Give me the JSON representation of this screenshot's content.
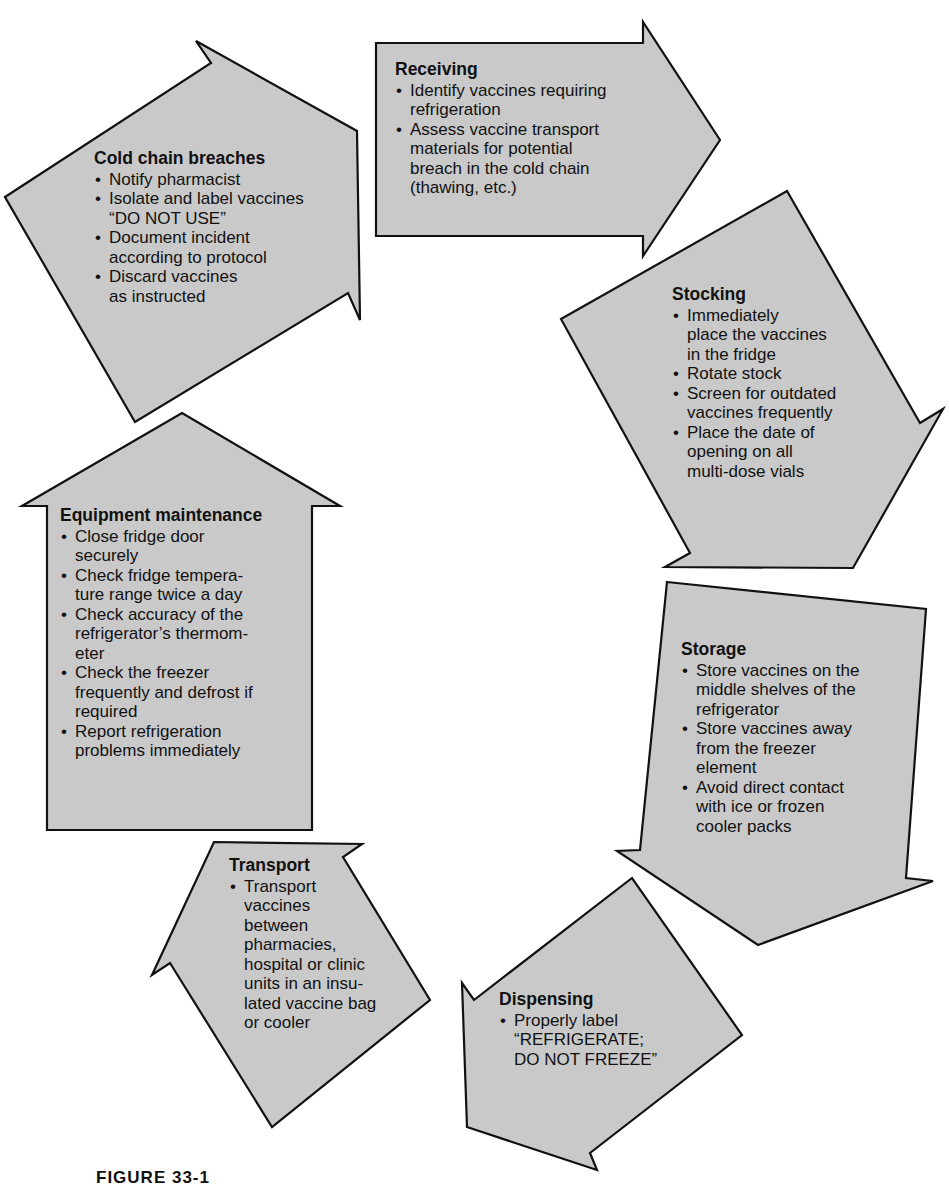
{
  "colors": {
    "arrow_fill": "#c9c9c9",
    "arrow_stroke": "#111111",
    "background": "#ffffff"
  },
  "diagram": {
    "type": "cycle",
    "steps": [
      {
        "id": "receiving",
        "title": "Receiving",
        "direction": "right",
        "bullets": [
          "Identify vaccines requiring\nrefrigeration",
          "Assess vaccine transport\nmaterials for potential\nbreach in the cold chain\n(thawing, etc.)"
        ]
      },
      {
        "id": "stocking",
        "title": "Stocking",
        "direction": "down-right",
        "bullets": [
          "Immediately\nplace the vaccines\nin the fridge",
          "Rotate stock",
          "Screen for outdated\nvaccines frequently",
          "Place the date of\nopening on all\nmulti-dose vials"
        ]
      },
      {
        "id": "storage",
        "title": "Storage",
        "direction": "down",
        "bullets": [
          "Store vaccines on the\nmiddle shelves of the\nrefrigerator",
          "Store vaccines away\nfrom the freezer\nelement",
          "Avoid direct contact\nwith ice or frozen\ncooler packs"
        ]
      },
      {
        "id": "dispensing",
        "title": "Dispensing",
        "direction": "down-left",
        "bullets": [
          "Properly label\n“REFRIGERATE;\nDO NOT FREEZE”"
        ]
      },
      {
        "id": "transport",
        "title": "Transport",
        "direction": "up-left",
        "bullets": [
          "Transport\nvaccines\nbetween\npharmacies,\nhospital or clinic\nunits in an insu-\nlated vaccine bag\nor cooler"
        ]
      },
      {
        "id": "equipment_maintenance",
        "title": "Equipment maintenance",
        "direction": "up",
        "bullets": [
          "Close fridge door\nsecurely",
          "Check fridge tempera-\nture range twice a day",
          "Check accuracy of the\nrefrigerator’s thermom-\neter",
          "Check the freezer\nfrequently and defrost if\nrequired",
          "Report refrigeration\nproblems immediately"
        ]
      },
      {
        "id": "cold_chain_breaches",
        "title": "Cold chain breaches",
        "direction": "up-right",
        "bullets": [
          "Notify pharmacist",
          "Isolate and label vaccines\n“DO NOT USE”",
          "Document incident\naccording to protocol",
          "Discard vaccines\nas instructed"
        ]
      }
    ]
  },
  "caption": "FIGURE 33-1"
}
